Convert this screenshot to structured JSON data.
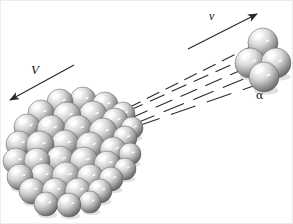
{
  "figure": {
    "background_color": "#ffffff",
    "width": 293,
    "height": 224,
    "border_color": "#ededed"
  },
  "labels": {
    "recoil_velocity": "V",
    "alpha_velocity": "v",
    "alpha_particle": "α"
  },
  "colors": {
    "sphere_highlight": "#ffffff",
    "sphere_light": "#f2f2f2",
    "sphere_mid": "#b9b9b9",
    "sphere_dark": "#6e6e6e",
    "sphere_edge": "#4a4a4a",
    "line": "#2b2b2b",
    "text": "#111111"
  },
  "arrows": {
    "recoil": {
      "name": "recoil-arrow",
      "x1": 73,
      "y1": 64,
      "x2": 9,
      "y2": 99,
      "direction": "left-down",
      "label": "V"
    },
    "emission": {
      "name": "emission-arrow",
      "x1": 187,
      "y1": 48,
      "x2": 256,
      "y2": 13,
      "direction": "right-up",
      "label": "v"
    }
  },
  "trajectory_lines": [
    {
      "x1": 127,
      "y1": 107,
      "x2": 275,
      "y2": 33,
      "dash": "14 7"
    },
    {
      "x1": 127,
      "y1": 110,
      "x2": 272,
      "y2": 45,
      "dash": "16 8"
    },
    {
      "x1": 130,
      "y1": 117,
      "x2": 268,
      "y2": 57,
      "dash": "18 9"
    },
    {
      "x1": 133,
      "y1": 123,
      "x2": 262,
      "y2": 70,
      "dash": "22 10"
    },
    {
      "x1": 134,
      "y1": 126,
      "x2": 258,
      "y2": 83,
      "dash": "26 12"
    }
  ],
  "nucleus": {
    "name": "heavy-nucleus",
    "sphere_count": 38,
    "center_x": 72,
    "center_y": 152,
    "radius": 66,
    "spheres": [
      {
        "cx": 59,
        "cy": 101,
        "r": 13
      },
      {
        "cx": 82,
        "cy": 99,
        "r": 13
      },
      {
        "cx": 104,
        "cy": 104,
        "r": 13
      },
      {
        "cx": 122,
        "cy": 113,
        "r": 12
      },
      {
        "cx": 40,
        "cy": 112,
        "r": 13
      },
      {
        "cx": 66,
        "cy": 115,
        "r": 14
      },
      {
        "cx": 92,
        "cy": 114,
        "r": 14
      },
      {
        "cx": 114,
        "cy": 120,
        "r": 13
      },
      {
        "cx": 131,
        "cy": 127,
        "r": 11
      },
      {
        "cx": 26,
        "cy": 126,
        "r": 13
      },
      {
        "cx": 50,
        "cy": 128,
        "r": 14
      },
      {
        "cx": 77,
        "cy": 128,
        "r": 14
      },
      {
        "cx": 102,
        "cy": 131,
        "r": 14
      },
      {
        "cx": 124,
        "cy": 137,
        "r": 12
      },
      {
        "cx": 18,
        "cy": 143,
        "r": 13
      },
      {
        "cx": 39,
        "cy": 144,
        "r": 14
      },
      {
        "cx": 64,
        "cy": 143,
        "r": 14
      },
      {
        "cx": 89,
        "cy": 145,
        "r": 14
      },
      {
        "cx": 112,
        "cy": 149,
        "r": 13
      },
      {
        "cx": 129,
        "cy": 153,
        "r": 11
      },
      {
        "cx": 15,
        "cy": 160,
        "r": 13
      },
      {
        "cx": 36,
        "cy": 160,
        "r": 13
      },
      {
        "cx": 59,
        "cy": 159,
        "r": 14
      },
      {
        "cx": 83,
        "cy": 160,
        "r": 14
      },
      {
        "cx": 106,
        "cy": 163,
        "r": 13
      },
      {
        "cx": 124,
        "cy": 168,
        "r": 11
      },
      {
        "cx": 19,
        "cy": 176,
        "r": 13
      },
      {
        "cx": 42,
        "cy": 175,
        "r": 13
      },
      {
        "cx": 65,
        "cy": 175,
        "r": 14
      },
      {
        "cx": 89,
        "cy": 176,
        "r": 13
      },
      {
        "cx": 110,
        "cy": 178,
        "r": 12
      },
      {
        "cx": 31,
        "cy": 190,
        "r": 13
      },
      {
        "cx": 54,
        "cy": 190,
        "r": 13
      },
      {
        "cx": 77,
        "cy": 190,
        "r": 13
      },
      {
        "cx": 99,
        "cy": 190,
        "r": 12
      },
      {
        "cx": 45,
        "cy": 203,
        "r": 12
      },
      {
        "cx": 68,
        "cy": 204,
        "r": 12
      },
      {
        "cx": 89,
        "cy": 201,
        "r": 11
      }
    ]
  },
  "alpha_cluster": {
    "name": "alpha-particle",
    "sphere_count": 4,
    "spheres": [
      {
        "cx": 262,
        "cy": 42,
        "r": 15
      },
      {
        "cx": 249,
        "cy": 62,
        "r": 15
      },
      {
        "cx": 275,
        "cy": 62,
        "r": 15
      },
      {
        "cx": 263,
        "cy": 76,
        "r": 15
      }
    ]
  }
}
